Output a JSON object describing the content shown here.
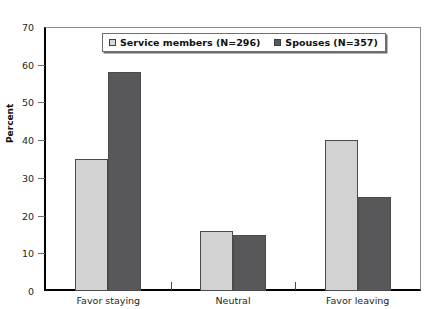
{
  "chart_data": {
    "type": "bar",
    "title": "",
    "subtitle": "",
    "xlabel": "",
    "ylabel": "Percent",
    "categories": [
      "Favor staying",
      "Neutral",
      "Favor leaving"
    ],
    "series": [
      {
        "name": "Service members (N=296)",
        "color": "#d2d2d2",
        "values": [
          35,
          16,
          40
        ]
      },
      {
        "name": "Spouses (N=357)",
        "color": "#58585a",
        "values": [
          58,
          14.8,
          25
        ]
      }
    ],
    "ylim": [
      0,
      70
    ],
    "yticks": [
      0,
      10,
      20,
      30,
      40,
      50,
      60,
      70
    ],
    "ytick_labels": [
      "0",
      "10",
      "20",
      "30",
      "40",
      "50",
      "60",
      "70"
    ],
    "grid": false,
    "legend_position": "top-center",
    "legend_entries": [
      "Service members (N=296)",
      "Spouses (N=357)"
    ],
    "annotations": []
  },
  "axes": {
    "y_title": "Percent"
  }
}
